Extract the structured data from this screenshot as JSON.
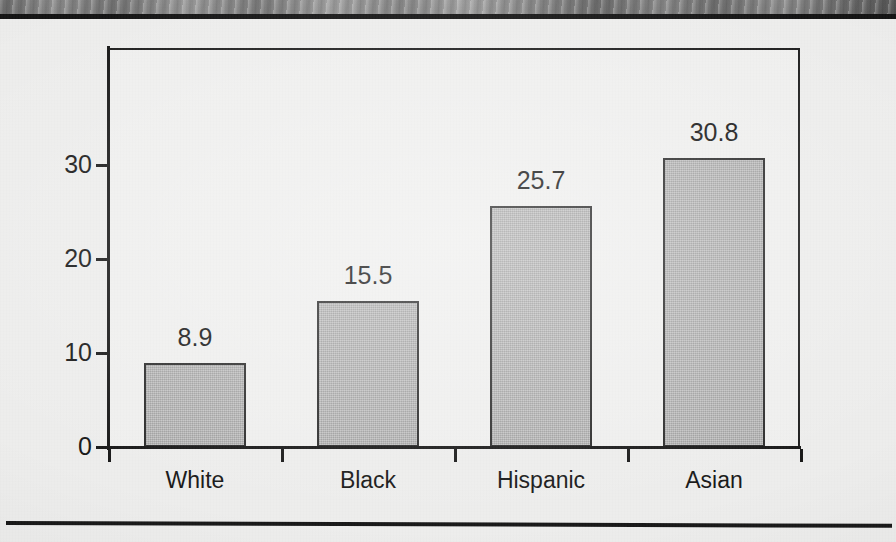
{
  "page": {
    "background_color": "#efefee",
    "rule_color": "#141414",
    "photo_strip_name": "photo-fragment"
  },
  "chart_data": {
    "type": "bar",
    "title": "",
    "subtitle": "",
    "xlabel": "",
    "ylabel": "",
    "categories": [
      "White",
      "Black",
      "Hispanic",
      "Asian"
    ],
    "values": [
      8.9,
      15.5,
      25.7,
      30.8
    ],
    "value_labels": [
      "8.9",
      "15.5",
      "25.7",
      "30.8"
    ],
    "yticks": [
      0,
      10,
      20,
      30
    ],
    "ytick_labels": [
      "0",
      "10",
      "20",
      "30"
    ],
    "ylim": [
      0,
      42.5
    ],
    "grid": false,
    "legend": null,
    "bar_fill_color": "#b2b2b2",
    "bar_edge_color": "#2a2a2a",
    "axis_color": "#161616",
    "text_color": "#151515"
  }
}
